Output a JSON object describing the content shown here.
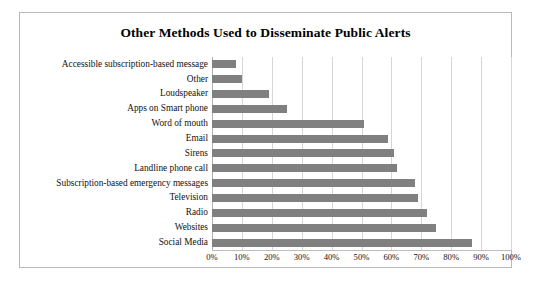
{
  "figure": {
    "title": "Other Methods Used to Disseminate Public Alerts"
  },
  "chart_data": {
    "type": "bar",
    "orientation": "horizontal",
    "title": "Other Methods Used to Disseminate Public Alerts",
    "xlabel": "",
    "ylabel": "",
    "xlim": [
      0,
      100
    ],
    "xticks": [
      "0%",
      "10%",
      "20%",
      "30%",
      "40%",
      "50%",
      "60%",
      "70%",
      "80%",
      "90%",
      "100%"
    ],
    "xtick_values": [
      0,
      10,
      20,
      30,
      40,
      50,
      60,
      70,
      80,
      90,
      100
    ],
    "grid": "vertical",
    "legend": "none",
    "bar_color": "#808080",
    "categories": [
      "Accessible subscription-based message",
      "Other",
      "Loudspeaker",
      "Apps on Smart phone",
      "Word of mouth",
      "Email",
      "Sirens",
      "Landline phone call",
      "Subscription-based emergency messages",
      "Television",
      "Radio",
      "Websites",
      "Social Media"
    ],
    "values": [
      8,
      10,
      19,
      25,
      51,
      59,
      61,
      62,
      68,
      69,
      72,
      75,
      87
    ]
  }
}
